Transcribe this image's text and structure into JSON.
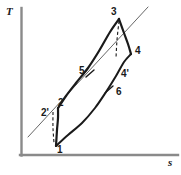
{
  "figure": {
    "background": "#ffffff",
    "line_color": "#1a1a1a",
    "axis_color": "#8a8a8a",
    "thin_line_color": "#555555"
  },
  "axes": {
    "y_label": "T",
    "x_label": "s",
    "origin": {
      "x": 21,
      "y": 155
    },
    "y_top": 8,
    "x_right": 178,
    "grid": false,
    "ticks": false
  },
  "state_labels": [
    {
      "id": "1",
      "text": "1",
      "x": 57,
      "y": 145
    },
    {
      "id": "2",
      "text": "2",
      "x": 58,
      "y": 98
    },
    {
      "id": "2p",
      "text": "2'",
      "x": 41,
      "y": 108
    },
    {
      "id": "3",
      "text": "3",
      "x": 111,
      "y": 7
    },
    {
      "id": "4",
      "text": "4",
      "x": 135,
      "y": 46
    },
    {
      "id": "4p",
      "text": "4'",
      "x": 121,
      "y": 69
    },
    {
      "id": "5",
      "text": "5",
      "x": 79,
      "y": 66
    },
    {
      "id": "6",
      "text": "6",
      "x": 116,
      "y": 87
    }
  ],
  "chart_data": {
    "type": "line",
    "xlabel": "s",
    "ylabel": "T",
    "xlim": [
      21,
      178
    ],
    "ylim": [
      155,
      8
    ],
    "grid": false,
    "legend": "none",
    "series": [
      {
        "name": "compression-1-2",
        "style": "solid-thick",
        "points": [
          [
            56,
            146
          ],
          [
            57,
            130
          ],
          [
            58,
            118
          ],
          [
            58,
            108
          ]
        ]
      },
      {
        "name": "heat-addition-2-5-3",
        "style": "solid-thick",
        "points": [
          [
            58,
            108
          ],
          [
            66,
            96
          ],
          [
            76,
            83
          ],
          [
            88,
            68
          ],
          [
            99,
            51
          ],
          [
            110,
            32
          ],
          [
            119,
            19
          ]
        ]
      },
      {
        "name": "expansion-3-4",
        "style": "solid-thick",
        "points": [
          [
            119,
            19
          ],
          [
            124,
            33
          ],
          [
            128,
            44
          ],
          [
            131,
            54
          ]
        ]
      },
      {
        "name": "exhaust-1-6-4p-4",
        "style": "solid-thick",
        "points": [
          [
            56,
            146
          ],
          [
            68,
            135
          ],
          [
            82,
            123
          ],
          [
            95,
            108
          ],
          [
            106,
            92
          ],
          [
            116,
            76
          ],
          [
            124,
            62
          ],
          [
            131,
            54
          ]
        ]
      },
      {
        "name": "isobar-thin-line",
        "style": "solid-thin",
        "points": [
          [
            28,
            137
          ],
          [
            148,
            7
          ]
        ]
      }
    ],
    "dashed_segments": [
      {
        "name": "dashed-3-to-4p",
        "points": [
          [
            119,
            21
          ],
          [
            117,
            40
          ],
          [
            116,
            58
          ]
        ]
      },
      {
        "name": "dashed-2p-to-1",
        "points": [
          [
            53,
            112
          ],
          [
            53,
            128
          ],
          [
            54,
            143
          ]
        ]
      }
    ],
    "tick_marks": [
      {
        "name": "tick-at-5",
        "x1": 86,
        "y1": 77,
        "x2": 94,
        "y2": 70
      },
      {
        "name": "tick-at-6",
        "x1": 105,
        "y1": 93,
        "x2": 113,
        "y2": 86
      }
    ],
    "annotations": [
      "1",
      "2",
      "2'",
      "3",
      "4",
      "4'",
      "5",
      "6"
    ]
  }
}
